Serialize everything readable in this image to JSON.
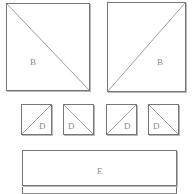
{
  "diagram": {
    "background_color": "#ffffff",
    "outline_color": "#6d6d6d",
    "diagonal_color": "#9a9a9a",
    "label_color": "#8a8a8a",
    "large_panels": [
      {
        "id": "panel-b-left",
        "label": "B",
        "x": 6,
        "y": 3,
        "width": 84,
        "height": 88,
        "diagonal": "top-left-to-bottom-right",
        "label_x": 30,
        "label_y": 58
      },
      {
        "id": "panel-b-right",
        "label": "B",
        "x": 107,
        "y": 2,
        "width": 79,
        "height": 90,
        "diagonal": "bottom-left-to-top-right",
        "label_x": 157,
        "label_y": 58
      }
    ],
    "small_panels": [
      {
        "id": "panel-d-1",
        "label": "D",
        "x": 21,
        "y": 104,
        "width": 31,
        "height": 31,
        "diagonal": "bottom-left-to-top-right",
        "label_x": 39,
        "label_y": 122
      },
      {
        "id": "panel-d-2",
        "label": "D",
        "x": 63,
        "y": 104,
        "width": 31,
        "height": 31,
        "diagonal": "top-left-to-bottom-right",
        "label_x": 68,
        "label_y": 122
      },
      {
        "id": "panel-d-3",
        "label": "D",
        "x": 106,
        "y": 104,
        "width": 31,
        "height": 31,
        "diagonal": "bottom-left-to-top-right",
        "label_x": 124,
        "label_y": 122
      },
      {
        "id": "panel-d-4",
        "label": "D",
        "x": 148,
        "y": 104,
        "width": 31,
        "height": 31,
        "diagonal": "top-left-to-bottom-right",
        "label_x": 153,
        "label_y": 122
      }
    ],
    "bottom_panel": {
      "id": "panel-e",
      "label": "E",
      "x": 22,
      "y": 150,
      "width": 155,
      "height": 36,
      "label_x": 97,
      "label_y": 167,
      "divider_y": 186,
      "strip_y": 187,
      "strip_height": 7
    }
  }
}
